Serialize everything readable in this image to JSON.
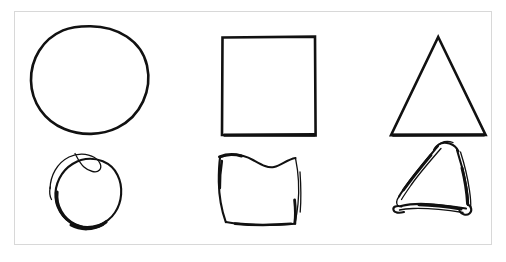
{
  "panel": {
    "name": "shape-comparison-panel",
    "background_color": "#ffffff",
    "border_color": "#d8d8d8",
    "ink_color": "#111111",
    "outer_background_color": "#ffffff",
    "grid": {
      "rows": 2,
      "columns": 3
    }
  },
  "rows": [
    {
      "id": "reference-row",
      "style": "clean",
      "description": "Clean geometric outlines",
      "cells": [
        {
          "shape": "circle",
          "label": "circle",
          "icon": "circle-outline-icon"
        },
        {
          "shape": "square",
          "label": "square",
          "icon": "square-outline-icon"
        },
        {
          "shape": "triangle",
          "label": "triangle",
          "icon": "triangle-outline-icon"
        }
      ]
    },
    {
      "id": "sketch-row",
      "style": "hand-drawn",
      "description": "Rough hand-drawn sketches of the same shapes",
      "cells": [
        {
          "shape": "circle",
          "label": "circle",
          "icon": "circle-sketch-icon"
        },
        {
          "shape": "square",
          "label": "square",
          "icon": "square-sketch-icon"
        },
        {
          "shape": "triangle",
          "label": "triangle",
          "icon": "triangle-sketch-icon"
        }
      ]
    }
  ]
}
